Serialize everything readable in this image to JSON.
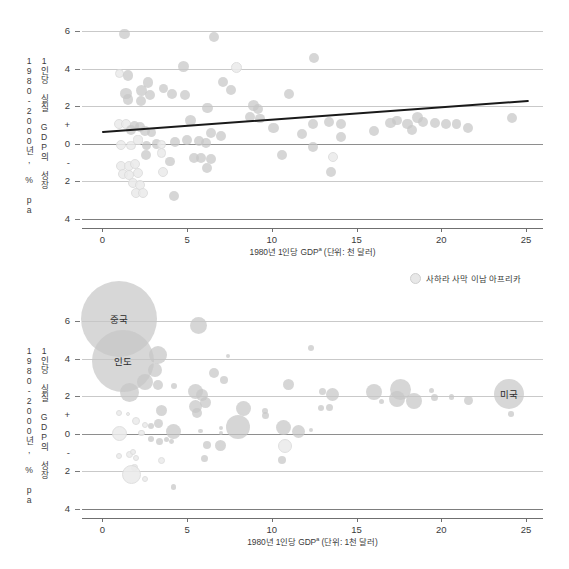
{
  "figure": {
    "background": "#ffffff",
    "accent_line": "#1a1a1a",
    "bubble_fill": "#c6c6c6",
    "bubble_fill_africa": "#ebebeb",
    "gridline_color": "#c9c9c9"
  },
  "legend": {
    "items": [
      {
        "label": "사하라 사막 이남 아프리카",
        "swatch_name": "africa-bubble-swatch",
        "color": "#e8e8e8"
      }
    ]
  },
  "chart_data": [
    {
      "id": "upper",
      "type": "scatter",
      "title": "",
      "xlabel": "1980년 1인당 GDP",
      "xlabel_sup": "a",
      "xlabel_unit": " (단위: 천 달러)",
      "ylabel_line1": "1980-2000년, % pa",
      "ylabel_line2": "1인당 실질 GDP의 성장",
      "xlim": [
        -1.2,
        26.0
      ],
      "ylim": [
        -4.6,
        6.6
      ],
      "xticks": [
        0,
        5,
        10,
        15,
        20,
        25
      ],
      "yticks": [
        "6",
        "4",
        "2",
        "+",
        "0",
        "-",
        "2",
        "4"
      ],
      "ytick_values": [
        6,
        4,
        2,
        1,
        0,
        -1,
        -2,
        -4
      ],
      "ytick_drawn": [
        6,
        4,
        2,
        0,
        -2,
        -4
      ],
      "grid": true,
      "legend_position": "none",
      "trendline": {
        "x0": 0.0,
        "y0": 0.62,
        "x1": 25.2,
        "y1": 2.28
      },
      "points": [
        {
          "x": 1.3,
          "y": 5.85,
          "r": 5.2,
          "g": 0
        },
        {
          "x": 6.6,
          "y": 5.7,
          "r": 5.2,
          "g": 0
        },
        {
          "x": 4.8,
          "y": 4.1,
          "r": 5.4,
          "g": 0
        },
        {
          "x": 7.9,
          "y": 4.05,
          "r": 5.4,
          "g": 1
        },
        {
          "x": 1.0,
          "y": 3.75,
          "r": 4.6,
          "g": 1
        },
        {
          "x": 1.5,
          "y": 3.65,
          "r": 5.2,
          "g": 0
        },
        {
          "x": 2.7,
          "y": 3.25,
          "r": 5.4,
          "g": 0
        },
        {
          "x": 7.1,
          "y": 3.3,
          "r": 5.0,
          "g": 0
        },
        {
          "x": 2.3,
          "y": 2.85,
          "r": 5.4,
          "g": 0
        },
        {
          "x": 3.6,
          "y": 2.95,
          "r": 4.6,
          "g": 0
        },
        {
          "x": 7.6,
          "y": 2.85,
          "r": 5.0,
          "g": 0
        },
        {
          "x": 1.4,
          "y": 2.7,
          "r": 5.6,
          "g": 0
        },
        {
          "x": 2.8,
          "y": 2.6,
          "r": 5.0,
          "g": 0
        },
        {
          "x": 4.1,
          "y": 2.65,
          "r": 5.0,
          "g": 0
        },
        {
          "x": 4.9,
          "y": 2.62,
          "r": 5.0,
          "g": 0
        },
        {
          "x": 1.5,
          "y": 2.35,
          "r": 5.2,
          "g": 0
        },
        {
          "x": 2.3,
          "y": 2.3,
          "r": 5.0,
          "g": 0
        },
        {
          "x": 11.0,
          "y": 2.65,
          "r": 5.0,
          "g": 0
        },
        {
          "x": 12.5,
          "y": 4.6,
          "r": 5.0,
          "g": 0
        },
        {
          "x": 8.9,
          "y": 2.05,
          "r": 5.6,
          "g": 0
        },
        {
          "x": 9.2,
          "y": 1.85,
          "r": 5.2,
          "g": 0
        },
        {
          "x": 6.2,
          "y": 1.9,
          "r": 5.2,
          "g": 0
        },
        {
          "x": 8.7,
          "y": 1.45,
          "r": 5.0,
          "g": 0
        },
        {
          "x": 9.3,
          "y": 1.35,
          "r": 4.8,
          "g": 0
        },
        {
          "x": 5.2,
          "y": 1.25,
          "r": 5.4,
          "g": 0
        },
        {
          "x": 1.0,
          "y": 1.05,
          "r": 5.2,
          "g": 1
        },
        {
          "x": 1.4,
          "y": 1.05,
          "r": 5.2,
          "g": 1
        },
        {
          "x": 1.9,
          "y": 0.95,
          "r": 4.8,
          "g": 0
        },
        {
          "x": 2.2,
          "y": 0.9,
          "r": 5.0,
          "g": 0
        },
        {
          "x": 1.7,
          "y": 0.72,
          "r": 5.0,
          "g": 0
        },
        {
          "x": 2.5,
          "y": 0.68,
          "r": 4.8,
          "g": 0
        },
        {
          "x": 2.9,
          "y": 0.62,
          "r": 4.6,
          "g": 0
        },
        {
          "x": 13.4,
          "y": 1.15,
          "r": 5.0,
          "g": 0
        },
        {
          "x": 14.1,
          "y": 1.05,
          "r": 5.0,
          "g": 0
        },
        {
          "x": 17.0,
          "y": 1.1,
          "r": 5.2,
          "g": 0
        },
        {
          "x": 18.6,
          "y": 1.4,
          "r": 5.4,
          "g": 0
        },
        {
          "x": 18.9,
          "y": 1.15,
          "r": 5.0,
          "g": 0
        },
        {
          "x": 19.6,
          "y": 1.1,
          "r": 5.0,
          "g": 0
        },
        {
          "x": 20.3,
          "y": 1.05,
          "r": 5.0,
          "g": 0
        },
        {
          "x": 20.9,
          "y": 1.05,
          "r": 4.8,
          "g": 0
        },
        {
          "x": 18.0,
          "y": 1.05,
          "r": 5.2,
          "g": 0
        },
        {
          "x": 17.4,
          "y": 1.25,
          "r": 4.8,
          "g": 0
        },
        {
          "x": 18.3,
          "y": 0.72,
          "r": 5.0,
          "g": 0
        },
        {
          "x": 21.6,
          "y": 0.82,
          "r": 5.0,
          "g": 0
        },
        {
          "x": 24.2,
          "y": 1.4,
          "r": 5.0,
          "g": 0
        },
        {
          "x": 16.0,
          "y": 0.68,
          "r": 5.0,
          "g": 0
        },
        {
          "x": 14.1,
          "y": 0.38,
          "r": 5.0,
          "g": 0
        },
        {
          "x": 12.4,
          "y": 1.05,
          "r": 5.0,
          "g": 0
        },
        {
          "x": 11.8,
          "y": 0.5,
          "r": 5.0,
          "g": 0
        },
        {
          "x": 10.1,
          "y": 0.85,
          "r": 5.2,
          "g": 0
        },
        {
          "x": 6.4,
          "y": 0.55,
          "r": 5.0,
          "g": 0
        },
        {
          "x": 7.0,
          "y": 0.42,
          "r": 5.0,
          "g": 0
        },
        {
          "x": 4.3,
          "y": 0.1,
          "r": 5.2,
          "g": 0
        },
        {
          "x": 5.0,
          "y": 0.2,
          "r": 5.0,
          "g": 0
        },
        {
          "x": 5.7,
          "y": 0.15,
          "r": 5.0,
          "g": 0
        },
        {
          "x": 6.1,
          "y": 0.05,
          "r": 5.0,
          "g": 0
        },
        {
          "x": 3.2,
          "y": 0.0,
          "r": 4.8,
          "g": 0
        },
        {
          "x": 1.1,
          "y": -0.05,
          "r": 5.0,
          "g": 1
        },
        {
          "x": 1.7,
          "y": -0.1,
          "r": 4.8,
          "g": 1
        },
        {
          "x": 2.1,
          "y": 0.2,
          "r": 4.6,
          "g": 1
        },
        {
          "x": 2.6,
          "y": -0.1,
          "r": 4.6,
          "g": 0
        },
        {
          "x": 3.5,
          "y": -0.05,
          "r": 4.8,
          "g": 1
        },
        {
          "x": 12.4,
          "y": -0.15,
          "r": 5.0,
          "g": 0
        },
        {
          "x": 13.6,
          "y": -0.7,
          "r": 5.0,
          "g": 1
        },
        {
          "x": 10.6,
          "y": -0.6,
          "r": 5.0,
          "g": 0
        },
        {
          "x": 2.6,
          "y": -0.6,
          "r": 5.0,
          "g": 0
        },
        {
          "x": 3.5,
          "y": -0.5,
          "r": 4.8,
          "g": 1
        },
        {
          "x": 4.0,
          "y": -0.95,
          "r": 4.8,
          "g": 0
        },
        {
          "x": 5.4,
          "y": -0.75,
          "r": 5.2,
          "g": 0
        },
        {
          "x": 5.8,
          "y": -0.75,
          "r": 5.0,
          "g": 0
        },
        {
          "x": 6.4,
          "y": -0.8,
          "r": 5.2,
          "g": 0
        },
        {
          "x": 6.2,
          "y": -1.3,
          "r": 5.0,
          "g": 0
        },
        {
          "x": 1.1,
          "y": -1.2,
          "r": 5.0,
          "g": 1
        },
        {
          "x": 1.6,
          "y": -1.2,
          "r": 5.0,
          "g": 1
        },
        {
          "x": 1.9,
          "y": -1.1,
          "r": 5.0,
          "g": 1
        },
        {
          "x": 1.2,
          "y": -1.6,
          "r": 5.0,
          "g": 1
        },
        {
          "x": 1.6,
          "y": -1.65,
          "r": 5.0,
          "g": 1
        },
        {
          "x": 2.1,
          "y": -1.55,
          "r": 5.0,
          "g": 1
        },
        {
          "x": 3.6,
          "y": -1.5,
          "r": 5.0,
          "g": 1
        },
        {
          "x": 1.8,
          "y": -2.1,
          "r": 5.0,
          "g": 1
        },
        {
          "x": 2.2,
          "y": -2.2,
          "r": 5.0,
          "g": 1
        },
        {
          "x": 2.0,
          "y": -2.6,
          "r": 5.0,
          "g": 1
        },
        {
          "x": 2.4,
          "y": -2.65,
          "r": 5.0,
          "g": 1
        },
        {
          "x": 4.2,
          "y": -2.8,
          "r": 5.0,
          "g": 0
        },
        {
          "x": 13.5,
          "y": -1.5,
          "r": 5.0,
          "g": 0
        }
      ]
    },
    {
      "id": "lower",
      "type": "scatter",
      "title": "",
      "xlabel": "1980년 1인당 GDP",
      "xlabel_sup": "a",
      "xlabel_unit": " (단위: 1천 달러)",
      "ylabel_line1": "1980-2000년, % pa",
      "ylabel_line2": "1인당 실질 GDP의 성장",
      "xlim": [
        -1.2,
        26.0
      ],
      "ylim": [
        -4.6,
        6.6
      ],
      "xticks": [
        0,
        5,
        10,
        15,
        20,
        25
      ],
      "yticks": [
        "6",
        "4",
        "2",
        "+",
        "0",
        "-",
        "2",
        "4"
      ],
      "ytick_values": [
        6,
        4,
        2,
        1,
        0,
        -1,
        -2,
        -4
      ],
      "ytick_drawn": [
        6,
        4,
        2,
        0,
        -2,
        -4
      ],
      "grid": true,
      "legend_position": "top-right",
      "trendline": null,
      "labeled_points": [
        {
          "label": "중국",
          "x": 1.0,
          "y": 6.1,
          "r": 38
        },
        {
          "label": "인도",
          "x": 1.2,
          "y": 3.9,
          "r": 31
        },
        {
          "label": "미국",
          "x": 24.0,
          "y": 2.1,
          "r": 15
        }
      ],
      "points": [
        {
          "x": 5.7,
          "y": 5.8,
          "r": 8.5,
          "g": 0
        },
        {
          "x": 12.3,
          "y": 4.6,
          "r": 3.0,
          "g": 0
        },
        {
          "x": 3.3,
          "y": 4.2,
          "r": 9.0,
          "g": 0
        },
        {
          "x": 7.4,
          "y": 4.15,
          "r": 2.2,
          "g": 0
        },
        {
          "x": 3.1,
          "y": 3.4,
          "r": 7.0,
          "g": 0
        },
        {
          "x": 6.6,
          "y": 3.25,
          "r": 5.0,
          "g": 0
        },
        {
          "x": 7.2,
          "y": 2.85,
          "r": 4.0,
          "g": 0
        },
        {
          "x": 11.0,
          "y": 2.65,
          "r": 5.5,
          "g": 0
        },
        {
          "x": 2.5,
          "y": 2.75,
          "r": 8.0,
          "g": 0
        },
        {
          "x": 3.3,
          "y": 2.6,
          "r": 5.0,
          "g": 0
        },
        {
          "x": 4.2,
          "y": 2.55,
          "r": 3.0,
          "g": 0
        },
        {
          "x": 1.6,
          "y": 2.2,
          "r": 9.5,
          "g": 0
        },
        {
          "x": 5.5,
          "y": 2.25,
          "r": 7.5,
          "g": 0
        },
        {
          "x": 5.9,
          "y": 2.05,
          "r": 6.0,
          "g": 0
        },
        {
          "x": 6.1,
          "y": 1.65,
          "r": 5.5,
          "g": 0
        },
        {
          "x": 5.5,
          "y": 1.45,
          "r": 6.5,
          "g": 0
        },
        {
          "x": 5.6,
          "y": 1.1,
          "r": 5.0,
          "g": 0
        },
        {
          "x": 3.5,
          "y": 1.25,
          "r": 5.5,
          "g": 0
        },
        {
          "x": 8.3,
          "y": 1.35,
          "r": 7.5,
          "g": 0
        },
        {
          "x": 9.6,
          "y": 1.2,
          "r": 3.0,
          "g": 0
        },
        {
          "x": 9.6,
          "y": 1.0,
          "r": 3.5,
          "g": 0
        },
        {
          "x": 1.0,
          "y": 1.1,
          "r": 3.0,
          "g": 1
        },
        {
          "x": 1.5,
          "y": 1.05,
          "r": 2.2,
          "g": 1
        },
        {
          "x": 2.0,
          "y": 0.7,
          "r": 4.0,
          "g": 1
        },
        {
          "x": 2.5,
          "y": 0.45,
          "r": 3.0,
          "g": 1
        },
        {
          "x": 3.3,
          "y": 0.55,
          "r": 4.5,
          "g": 0
        },
        {
          "x": 2.9,
          "y": 0.4,
          "r": 3.0,
          "g": 0
        },
        {
          "x": 8.0,
          "y": 0.35,
          "r": 12.0,
          "g": 0
        },
        {
          "x": 4.2,
          "y": 0.1,
          "r": 7.5,
          "g": 0
        },
        {
          "x": 1.0,
          "y": 0.0,
          "r": 7.5,
          "g": 1
        },
        {
          "x": 2.3,
          "y": 0.05,
          "r": 3.2,
          "g": 1
        },
        {
          "x": 7.0,
          "y": 0.3,
          "r": 2.2,
          "g": 0
        },
        {
          "x": 7.0,
          "y": 0.05,
          "r": 2.2,
          "g": 0
        },
        {
          "x": 5.8,
          "y": 0.15,
          "r": 2.2,
          "g": 0
        },
        {
          "x": 10.7,
          "y": 0.35,
          "r": 7.5,
          "g": 0
        },
        {
          "x": 12.3,
          "y": 0.2,
          "r": 2.2,
          "g": 0
        },
        {
          "x": 10.8,
          "y": -0.65,
          "r": 7.0,
          "g": 1
        },
        {
          "x": 2.9,
          "y": -0.3,
          "r": 3.0,
          "g": 0
        },
        {
          "x": 3.4,
          "y": -0.4,
          "r": 3.5,
          "g": 0
        },
        {
          "x": 4.1,
          "y": -0.4,
          "r": 2.4,
          "g": 0
        },
        {
          "x": 3.8,
          "y": -0.3,
          "r": 2.6,
          "g": 0
        },
        {
          "x": 6.2,
          "y": -0.6,
          "r": 4.0,
          "g": 0
        },
        {
          "x": 7.0,
          "y": -0.65,
          "r": 5.5,
          "g": 0
        },
        {
          "x": 1.0,
          "y": -1.2,
          "r": 3.0,
          "g": 1
        },
        {
          "x": 1.6,
          "y": -1.1,
          "r": 3.5,
          "g": 1
        },
        {
          "x": 1.8,
          "y": -0.95,
          "r": 3.0,
          "g": 1
        },
        {
          "x": 2.0,
          "y": -1.3,
          "r": 3.0,
          "g": 1
        },
        {
          "x": 3.5,
          "y": -1.45,
          "r": 3.5,
          "g": 1
        },
        {
          "x": 6.0,
          "y": -1.3,
          "r": 3.5,
          "g": 0
        },
        {
          "x": 10.6,
          "y": -1.4,
          "r": 4.0,
          "g": 0
        },
        {
          "x": 1.9,
          "y": -1.8,
          "r": 3.2,
          "g": 1
        },
        {
          "x": 1.7,
          "y": -2.15,
          "r": 9.5,
          "g": 1
        },
        {
          "x": 2.5,
          "y": -2.4,
          "r": 3.0,
          "g": 1
        },
        {
          "x": 4.2,
          "y": -2.85,
          "r": 2.8,
          "g": 0
        },
        {
          "x": 13.6,
          "y": 2.1,
          "r": 6.5,
          "g": 0
        },
        {
          "x": 13.0,
          "y": 2.25,
          "r": 3.5,
          "g": 0
        },
        {
          "x": 13.4,
          "y": 1.4,
          "r": 3.5,
          "g": 0
        },
        {
          "x": 16.0,
          "y": 2.25,
          "r": 8.0,
          "g": 0
        },
        {
          "x": 17.6,
          "y": 2.35,
          "r": 10.5,
          "g": 0
        },
        {
          "x": 17.4,
          "y": 1.85,
          "r": 8.0,
          "g": 0
        },
        {
          "x": 18.4,
          "y": 1.75,
          "r": 8.0,
          "g": 0
        },
        {
          "x": 16.5,
          "y": 1.7,
          "r": 2.5,
          "g": 0
        },
        {
          "x": 19.4,
          "y": 2.3,
          "r": 2.6,
          "g": 0
        },
        {
          "x": 19.6,
          "y": 1.95,
          "r": 3.5,
          "g": 0
        },
        {
          "x": 20.6,
          "y": 1.95,
          "r": 2.8,
          "g": 0
        },
        {
          "x": 21.6,
          "y": 1.75,
          "r": 4.5,
          "g": 0
        },
        {
          "x": 12.9,
          "y": 1.4,
          "r": 3.0,
          "g": 0
        },
        {
          "x": 24.1,
          "y": 1.05,
          "r": 2.8,
          "g": 0
        },
        {
          "x": 11.6,
          "y": 0.1,
          "r": 6.5,
          "g": 0
        }
      ]
    }
  ]
}
